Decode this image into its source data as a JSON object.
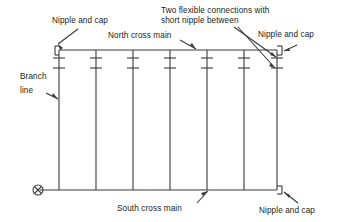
{
  "diagram": {
    "line_color": "#3a3a3a",
    "text_color": "#1a1a1a",
    "background": "#ffffff",
    "labels": {
      "nipple_cap_top_left": "Nipple and cap",
      "nipple_cap_top_right": "Nipple and cap",
      "nipple_cap_bottom_right": "Nipple and cap",
      "north_cross_main": "North cross main",
      "south_cross_main": "South cross main",
      "branch_line_1": "Branch",
      "branch_line_2": "line",
      "flexible_1": "Two flexible connections with",
      "flexible_2": "short nipple between"
    },
    "components": {
      "riser_count": 7,
      "coupling_marks_per_riser": 2,
      "end_caps": 3,
      "supply_marker": "circled-x-supply-riser"
    }
  }
}
